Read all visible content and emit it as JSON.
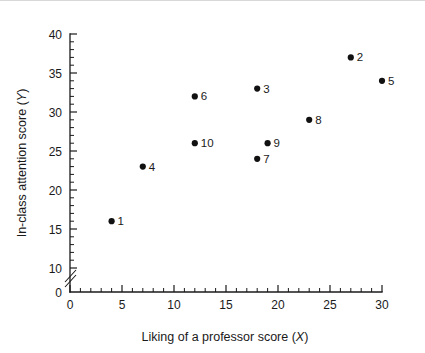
{
  "chart_data": {
    "type": "scatter",
    "title": "",
    "xlabel": "Liking of a professor score (X)",
    "xlabel_text": "Liking of a professor score (",
    "xlabel_var": "X",
    "xlabel_tail": ")",
    "ylabel": "In-class attention score (Y)",
    "ylabel_text": "In-class attention score (",
    "ylabel_var": "Y",
    "ylabel_tail": ")",
    "xlim": [
      0,
      30
    ],
    "ylim": [
      0,
      40
    ],
    "y_axis_break": true,
    "y_break_between": [
      0,
      10
    ],
    "grid": false,
    "legend": "none",
    "x_major_ticks": [
      0,
      5,
      10,
      15,
      20,
      25,
      30
    ],
    "x_tick_labels": [
      "0",
      "5",
      "10",
      "15",
      "20",
      "25",
      "30"
    ],
    "x_minor_interval": 1,
    "y_major_ticks": [
      0,
      10,
      15,
      20,
      25,
      30,
      35,
      40
    ],
    "y_tick_labels": [
      "0",
      "10",
      "15",
      "20",
      "25",
      "30",
      "35",
      "40"
    ],
    "y_minor_interval": 1,
    "marker": "filled-circle",
    "marker_color": "#111111",
    "points": [
      {
        "label": "1",
        "x": 4,
        "y": 16
      },
      {
        "label": "4",
        "x": 7,
        "y": 23
      },
      {
        "label": "6",
        "x": 12,
        "y": 32
      },
      {
        "label": "10",
        "x": 12,
        "y": 26
      },
      {
        "label": "7",
        "x": 18,
        "y": 24
      },
      {
        "label": "3",
        "x": 18,
        "y": 33
      },
      {
        "label": "9",
        "x": 19,
        "y": 26
      },
      {
        "label": "8",
        "x": 23,
        "y": 29
      },
      {
        "label": "2",
        "x": 27,
        "y": 37
      },
      {
        "label": "5",
        "x": 30,
        "y": 34
      }
    ]
  },
  "colors": {
    "background": "#ffffff",
    "axis": "#1a1a1a",
    "marker": "#111111",
    "topline": "#d8d8d8"
  }
}
